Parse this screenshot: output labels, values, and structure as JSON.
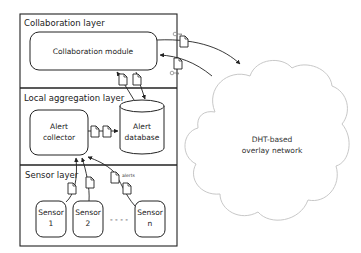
{
  "diagram": {
    "layers": [
      {
        "id": "collaboration",
        "label": "Collaboration layer"
      },
      {
        "id": "aggregation",
        "label": "Local aggregation layer"
      },
      {
        "id": "sensor",
        "label": "Sensor layer"
      }
    ],
    "nodes": {
      "collaboration_module": {
        "label": "Collaboration module"
      },
      "alert_collector": {
        "line1": "Alert",
        "line2": "collector"
      },
      "alert_database": {
        "line1": "Alert",
        "line2": "database"
      },
      "sensors": [
        {
          "line1": "Sensor",
          "line2": "1"
        },
        {
          "line1": "Sensor",
          "line2": "2"
        },
        {
          "line1": "Sensor",
          "line2": "n"
        }
      ],
      "ellipsis": "- - - -",
      "overlay": {
        "line1": "DHT-based",
        "line2": "overlay network"
      }
    },
    "annotations": {
      "alerts": "alerts"
    },
    "edges": [
      {
        "from": "collaboration_module",
        "to": "overlay",
        "payload": "document"
      },
      {
        "from": "overlay",
        "to": "collaboration_module",
        "payload": "document"
      },
      {
        "from": "alert_database",
        "to": "collaboration_module",
        "payload": "document"
      },
      {
        "from": "collaboration_module",
        "to": "alert_database",
        "payload": "document"
      },
      {
        "from": "alert_collector",
        "to": "alert_database",
        "payload": "documents"
      },
      {
        "from": "sensor_1",
        "to": "alert_collector",
        "payload": "document"
      },
      {
        "from": "sensor_2",
        "to": "alert_collector",
        "payload": "document"
      },
      {
        "from": "sensor_n",
        "to": "alert_collector",
        "payload": "alerts"
      }
    ],
    "colors": {
      "stroke": "#222222",
      "cloud_stroke": "#c8c8c8",
      "background": "#ffffff"
    }
  }
}
